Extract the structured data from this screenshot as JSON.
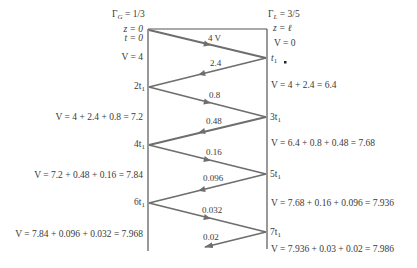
{
  "diagram": {
    "left_end": {
      "gamma": "Γ",
      "gamma_sub": "G",
      "gamma_value": " = 1/3",
      "z_label": "z = 0",
      "t_label": "t = 0"
    },
    "right_end": {
      "gamma": "Γ",
      "gamma_sub": "L",
      "gamma_value": " = 3/5",
      "z_label": "z = ℓ",
      "v_initial": "V = 0"
    },
    "time_labels": {
      "t1": "t",
      "t1_sub": "1",
      "t2": "2t",
      "t2_sub": "1",
      "t3": "3t",
      "t3_sub": "1",
      "t4": "4t",
      "t4_sub": "1",
      "t5": "5t",
      "t5_sub": "1",
      "t6": "6t",
      "t6_sub": "1",
      "t7": "7t",
      "t7_sub": "1"
    },
    "wave_labels": [
      "4 V",
      "2.4",
      "0.8",
      "0.48",
      "0.16",
      "0.096",
      "0.032",
      "0.02"
    ],
    "left_voltages": [
      "V = 4",
      "V = 4 + 2.4 + 0.8 = 7.2",
      "V = 7.2 + 0.48 + 0.16 = 7.84",
      "V = 7.84 + 0.096 + 0.032 = 7.968"
    ],
    "right_voltages": [
      "V = 4 + 2.4 = 6.4",
      "V = 6.4 + 0.8 + 0.48 = 7.68",
      "V = 7.68 + 0.16 + 0.096 = 7.936",
      "V = 7.936 + 0.03 + 0.02 = 7.986"
    ],
    "colors": {
      "line": "#555555",
      "wave": "#6e6e6e",
      "text": "#3a3a3a"
    }
  }
}
